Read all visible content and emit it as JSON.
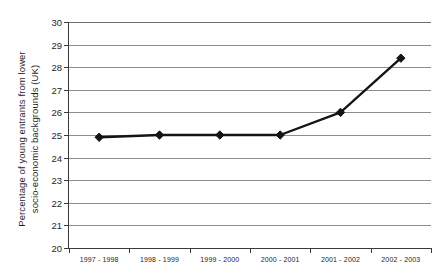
{
  "chart_data": {
    "type": "line",
    "title": "",
    "xlabel": "",
    "ylabel": "Percentage of young entrants from lower socio-economic backgrounds (UK)",
    "ylabel_line1": "Percentage of young entrants from lower",
    "ylabel_line2": "socio-economic backgrounds (UK)",
    "categories": [
      "1997 - 1998",
      "1998 - 1999",
      "1999 - 2000",
      "2000 - 2001",
      "2001 - 2002",
      "2002 - 2003"
    ],
    "values": [
      24.9,
      25.0,
      25.0,
      25.0,
      26.0,
      28.4
    ],
    "ylim": [
      20,
      30
    ],
    "ytick_labels": [
      "20",
      "21",
      "22",
      "23",
      "24",
      "25",
      "26",
      "27",
      "28",
      "29",
      "30"
    ],
    "ytick_step": 1,
    "grid": true,
    "grid_axis": "y",
    "legend": false,
    "legend_position": "none",
    "marker": "diamond",
    "series_color": "#141414",
    "grid_color": "#8e8e8e",
    "axis_color": "#3a3a3a",
    "background_color": "#ffffff"
  }
}
